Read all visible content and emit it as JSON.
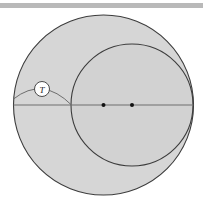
{
  "page": {
    "width": 203,
    "height": 210,
    "background": "#ffffff"
  },
  "top_rule": {
    "name": "horizontal-divider",
    "color": "#b9b9b9",
    "x": 0,
    "y": 3,
    "width": 203,
    "height": 5
  },
  "colors": {
    "fill_gray": "#d6d6d6",
    "outline_dark": "#3c3c3c",
    "outline_light": "#6e6e6e",
    "dot": "#111111",
    "label_bubble_fill": "#ffffff",
    "label_text": "#1a1a1a"
  },
  "chart_data": {
    "type": "diagram",
    "title": "",
    "shapes": [
      {
        "id": "outer-circle",
        "kind": "circle",
        "cx": 103.5,
        "cy": 105,
        "r": 90,
        "fill": "#d6d6d6",
        "stroke": "#3c3c3c"
      },
      {
        "id": "inner-circle",
        "kind": "circle",
        "cx": 132,
        "cy": 105,
        "r": 61,
        "fill": "#d6d6d6",
        "stroke": "#3c3c3c"
      },
      {
        "id": "diameter-line",
        "kind": "line",
        "x1": 13.5,
        "y1": 105,
        "x2": 193.5,
        "y2": 105,
        "stroke": "#6e6e6e"
      },
      {
        "id": "left-arc",
        "kind": "arc",
        "from_x": 13.5,
        "from_y": 99,
        "to_x": 71.5,
        "to_y": 105,
        "stroke": "#6e6e6e"
      }
    ],
    "points": [
      {
        "id": "inner-center-left",
        "label": "",
        "x": 103.5,
        "y": 105,
        "r": 2
      },
      {
        "id": "inner-center-right",
        "label": "",
        "x": 132,
        "y": 105,
        "r": 2
      }
    ],
    "annotations": [
      {
        "id": "label-T",
        "text": "T",
        "x": 42,
        "y": 89,
        "bubble_radius": 7.5,
        "style": "circled-italic"
      }
    ]
  }
}
